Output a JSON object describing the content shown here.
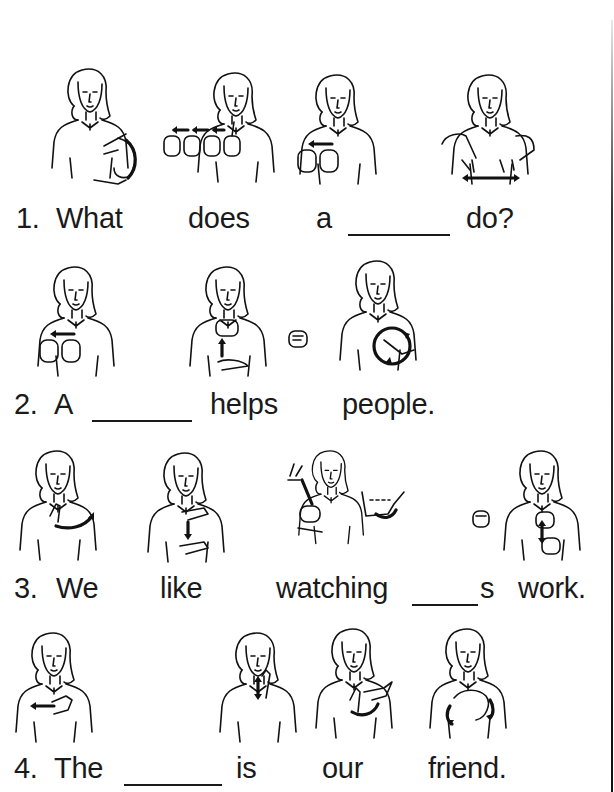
{
  "worksheet": {
    "sentences": [
      {
        "number": "1.",
        "words": [
          "What",
          "does",
          "a",
          "do?"
        ],
        "blank": "_______",
        "signs": [
          "what-sign",
          "does-fingerspelled",
          "a-sign",
          "do-sign"
        ]
      },
      {
        "number": "2.",
        "words": [
          "A",
          "helps",
          "people."
        ],
        "blank": "_______",
        "signs": [
          "a-sign",
          "help-sign",
          "people-sign"
        ]
      },
      {
        "number": "3.",
        "words": [
          "We",
          "like",
          "watching",
          "s",
          "work."
        ],
        "blank": "_____",
        "signs": [
          "we-sign",
          "like-sign",
          "watching-sign",
          "s-handshape",
          "work-sign"
        ]
      },
      {
        "number": "4.",
        "words": [
          "The",
          "is",
          "our",
          "friend."
        ],
        "blank": "_______",
        "signs": [
          "the-sign",
          "is-sign",
          "our-sign",
          "friend-sign"
        ]
      }
    ]
  },
  "colors": {
    "ink": "#1a1a1a",
    "paper": "#ffffff"
  }
}
